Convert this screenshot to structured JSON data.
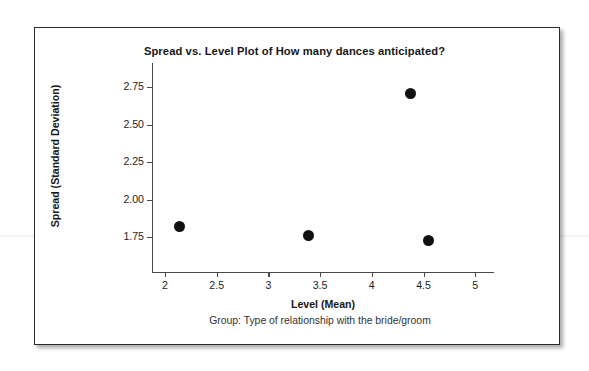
{
  "figure": {
    "title": "Spread vs. Level Plot of How many dances anticipated?",
    "group_caption": "Group: Type of relationship with the bride/groom",
    "border_color": "#2b2b2b",
    "background": "#ffffff"
  },
  "chart_data": {
    "type": "scatter",
    "title": "Spread vs. Level Plot of How many dances anticipated?",
    "xlabel": "Level (Mean)",
    "ylabel": "Spread (Standard Deviation)",
    "caption": "Group: Type of relationship with the bride/groom",
    "xlim": [
      1.87,
      5.18
    ],
    "ylim": [
      1.68,
      2.81
    ],
    "xticks": [
      2,
      2.5,
      3,
      3.5,
      4,
      4.5,
      5
    ],
    "xticklabels": [
      "2",
      "2.5",
      "3",
      "3.5",
      "4",
      "4.5",
      "5"
    ],
    "yticks": [
      1.75,
      2.0,
      2.25,
      2.5,
      2.75
    ],
    "yticklabels": [
      "1.75",
      "2.00",
      "2.25",
      "2.50",
      "2.75"
    ],
    "grid": false,
    "legend": null,
    "marker": "filled-circle",
    "marker_color": "#111111",
    "marker_size_px": 11,
    "points": [
      {
        "x": 2.14,
        "y": 1.82
      },
      {
        "x": 3.39,
        "y": 1.76
      },
      {
        "x": 4.37,
        "y": 2.71
      },
      {
        "x": 4.55,
        "y": 1.73
      }
    ],
    "x": [
      2.14,
      3.39,
      4.37,
      4.55
    ],
    "values": [
      1.82,
      1.76,
      2.71,
      1.73
    ]
  }
}
